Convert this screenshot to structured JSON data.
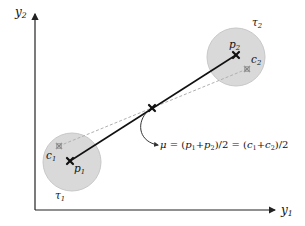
{
  "diagram": {
    "axes": {
      "x_label_base": "y",
      "x_label_sub": "1",
      "y_label_base": "y",
      "y_label_sub": "2"
    },
    "clusters": [
      {
        "name": "tau1",
        "label_base": "τ",
        "label_sub": "1",
        "circle": {
          "cx": 72,
          "cy": 162,
          "r": 29,
          "fill": "#d9d9d9",
          "stroke": "#c4c4c4"
        },
        "p_point": {
          "label_base": "p",
          "label_sub": "1",
          "x": 70,
          "y": 161
        },
        "c_point": {
          "label_base": "c",
          "label_sub": "1",
          "x": 59,
          "y": 146
        }
      },
      {
        "name": "tau2",
        "label_base": "τ",
        "label_sub": "2",
        "circle": {
          "cx": 236,
          "cy": 57,
          "r": 29,
          "fill": "#d9d9d9",
          "stroke": "#c4c4c4"
        },
        "p_point": {
          "label_base": "p",
          "label_sub": "2",
          "x": 236,
          "y": 55
        },
        "c_point": {
          "label_base": "c",
          "label_sub": "2",
          "x": 247,
          "y": 69
        }
      }
    ],
    "midpoint": {
      "x": 152,
      "y": 108
    },
    "formula": {
      "mu": "μ",
      "eq1": " = (",
      "p1": "p",
      "p1_sub": "1",
      "plus1": "+",
      "p2": "p",
      "p2_sub": "2",
      "div1": ")/2 = (",
      "c1": "c",
      "c1_sub": "1",
      "plus2": "+",
      "c2": "c",
      "c2_sub": "2",
      "div2": ")/2"
    },
    "colors": {
      "solid_line": "#111111",
      "dashed_line": "#b0b0b0",
      "marker": "#111111",
      "c_marker": "#888888",
      "axis": "#222222"
    }
  }
}
